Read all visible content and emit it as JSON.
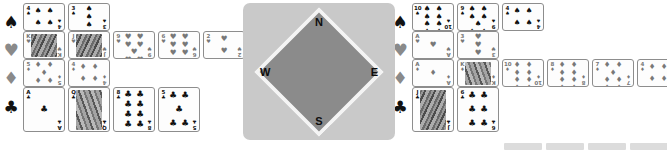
{
  "app": {
    "title": "Bridge Hand Display",
    "suit_symbols": {
      "spade": "♠",
      "heart": "♥",
      "diamond": "♦",
      "club": "♣"
    }
  },
  "compass": {
    "name": "compass-rose",
    "north": "N",
    "south": "S",
    "east": "E",
    "west": "W",
    "plate_color": "#c9c9c9",
    "diamond_color": "#8b8b8b"
  },
  "suit_legend": [
    {
      "suit": "spade",
      "symbol": "♠",
      "color": "#121212"
    },
    {
      "suit": "heart",
      "symbol": "♥",
      "color": "#8a8a8a"
    },
    {
      "suit": "diamond",
      "symbol": "♦",
      "color": "#8a8a8a"
    },
    {
      "suit": "club",
      "symbol": "♣",
      "color": "#121212"
    }
  ],
  "hands": {
    "west": {
      "label": "West",
      "rows": [
        {
          "suit": "spade",
          "symbol": "♠",
          "color": "black",
          "cards": [
            {
              "rank": "4",
              "pips": 4
            },
            {
              "rank": "3",
              "pips": 3
            }
          ]
        },
        {
          "suit": "heart",
          "symbol": "♥",
          "color": "red",
          "cards": [
            {
              "rank": "K",
              "face": true
            },
            {
              "rank": "J",
              "face": true
            },
            {
              "rank": "9",
              "pips": 9
            },
            {
              "rank": "6",
              "pips": 6
            },
            {
              "rank": "2",
              "pips": 2
            }
          ]
        },
        {
          "suit": "diamond",
          "symbol": "♦",
          "color": "red",
          "cards": [
            {
              "rank": "5",
              "pips": 5
            },
            {
              "rank": "4",
              "pips": 4
            }
          ]
        },
        {
          "suit": "club",
          "symbol": "♣",
          "color": "black",
          "cards": [
            {
              "rank": "A",
              "pips": 1
            },
            {
              "rank": "Q",
              "face": true
            },
            {
              "rank": "8",
              "pips": 8
            },
            {
              "rank": "5",
              "pips": 5
            }
          ]
        }
      ]
    },
    "east": {
      "label": "East",
      "rows": [
        {
          "suit": "spade",
          "symbol": "♠",
          "color": "black",
          "cards": [
            {
              "rank": "10",
              "pips": 10
            },
            {
              "rank": "9",
              "pips": 9
            },
            {
              "rank": "4",
              "pips": 4
            }
          ]
        },
        {
          "suit": "heart",
          "symbol": "♥",
          "color": "red",
          "cards": [
            {
              "rank": "A",
              "pips": 1
            },
            {
              "rank": "3",
              "pips": 3
            }
          ]
        },
        {
          "suit": "diamond",
          "symbol": "♦",
          "color": "red",
          "cards": [
            {
              "rank": "A",
              "pips": 1
            },
            {
              "rank": "K",
              "face": true
            },
            {
              "rank": "10",
              "pips": 10
            },
            {
              "rank": "8",
              "pips": 8
            },
            {
              "rank": "7",
              "pips": 7
            },
            {
              "rank": "4",
              "pips": 4
            }
          ]
        },
        {
          "suit": "club",
          "symbol": "♣",
          "color": "black",
          "cards": [
            {
              "rank": "J",
              "face": true
            },
            {
              "rank": "6",
              "pips": 6
            }
          ]
        }
      ]
    }
  },
  "toolbar": {
    "buttons": [
      "",
      "",
      "",
      ""
    ]
  }
}
